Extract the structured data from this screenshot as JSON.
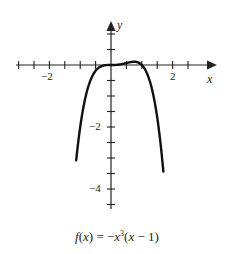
{
  "chart_data": {
    "type": "line",
    "title": "",
    "caption": "f(x) = −x³(x − 1)",
    "function": "-x^3*(x-1)",
    "xlabel": "x",
    "ylabel": "y",
    "xlim": [
      -3,
      3.3
    ],
    "ylim": [
      -4.6,
      1.4
    ],
    "x_tick_step": 0.5,
    "y_tick_step": 0.5,
    "x_tick_labels": [
      {
        "value": -2,
        "label": "−2"
      },
      {
        "value": 2,
        "label": "2"
      }
    ],
    "y_tick_labels": [
      {
        "value": -2,
        "label": "−2"
      },
      {
        "value": -4,
        "label": "−4"
      }
    ],
    "grid": false,
    "legend": null,
    "series": [
      {
        "name": "f(x)",
        "x": [
          -1.13,
          -1.0,
          -0.8,
          -0.6,
          -0.4,
          -0.2,
          0,
          0.2,
          0.4,
          0.6,
          0.75,
          0.9,
          1.0,
          1.2,
          1.4,
          1.6,
          1.7
        ],
        "values": [
          -3.07,
          -2.0,
          -0.92,
          -0.35,
          -0.09,
          -0.01,
          0,
          0.01,
          0.04,
          0.09,
          0.11,
          0.07,
          0,
          -0.35,
          -1.1,
          -2.46,
          -3.44
        ]
      }
    ]
  },
  "labels": {
    "x_axis": "x",
    "y_axis": "y",
    "x_neg2": "−2",
    "x_pos2": "2",
    "y_neg2": "−2",
    "y_neg4": "−4",
    "caption": "f(x) = −x³(x − 1)"
  },
  "colors": {
    "axis": "#222222",
    "curve": "#111111",
    "background": "#ffffff"
  }
}
